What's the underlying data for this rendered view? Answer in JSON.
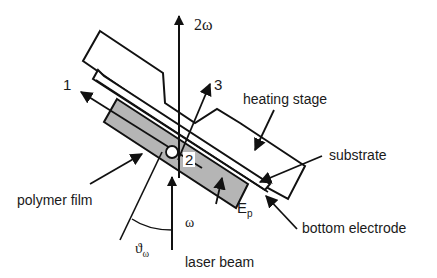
{
  "diagram": {
    "labels": {
      "two_omega": "2ω",
      "axis_1": "1",
      "axis_2": "2",
      "axis_3": "3",
      "heating_stage": "heating stage",
      "substrate": "substrate",
      "polymer_film": "polymer film",
      "bottom_electrode": "bottom electrode",
      "omega": "ω",
      "theta": "ϑ",
      "theta_sub": "ω",
      "e_field": "E",
      "e_field_sub": "p",
      "laser_beam": "laser beam"
    },
    "colors": {
      "stroke": "#111111",
      "film_fill": "#b5b5b5",
      "background": "#ffffff"
    }
  }
}
